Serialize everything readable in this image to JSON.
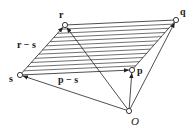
{
  "diagram": {
    "points": {
      "O": {
        "label": "O",
        "x": 129,
        "y": 111
      },
      "s": {
        "label": "s",
        "x": 20,
        "y": 75
      },
      "r": {
        "label": "r",
        "x": 65,
        "y": 25
      },
      "p": {
        "label": "p",
        "x": 132,
        "y": 70
      },
      "q": {
        "label": "q",
        "x": 176,
        "y": 20
      }
    },
    "vector_labels": {
      "r_minus_s": "r − s",
      "p_minus_s": "p − s"
    },
    "hatch_line_count": 12,
    "colors": {
      "stroke": "#222222",
      "background": "#ffffff"
    }
  }
}
